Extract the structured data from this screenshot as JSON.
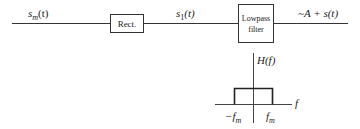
{
  "diagram": {
    "input_signal": "s",
    "input_signal_sub": "m",
    "input_signal_arg": "(t)",
    "block1": {
      "label": "Rect."
    },
    "intermediate_signal": "s",
    "intermediate_signal_sub": "1",
    "intermediate_signal_arg": "(t)",
    "block2": {
      "line1": "Lowpass",
      "line2": "filter"
    },
    "output_signal": "~A + s(t)",
    "frequency_response": {
      "label": "H(f)",
      "axis_label": "f",
      "neg_cutoff": "−f",
      "neg_cutoff_sub": "m",
      "pos_cutoff": "f",
      "pos_cutoff_sub": "m",
      "shape": "rectangular passband from -f_m to f_m"
    }
  }
}
